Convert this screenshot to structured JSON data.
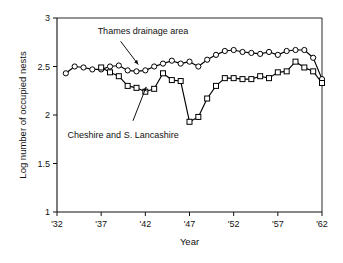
{
  "chart_data": {
    "type": "line",
    "title": "",
    "xlabel": "Year",
    "ylabel": "Log number of occupied nests",
    "xlim": [
      1932,
      1962
    ],
    "ylim": [
      1,
      3
    ],
    "grid": false,
    "legend_position": "inline-annotations",
    "xticks": [
      1932,
      1937,
      1942,
      1947,
      1952,
      1957,
      1962
    ],
    "xtick_labels": [
      "'32",
      "'37",
      "'42",
      "'47",
      "'52",
      "'57",
      "'62"
    ],
    "yticks": [
      1,
      1.5,
      2,
      2.5,
      3
    ],
    "ytick_labels": [
      "1",
      "1.5",
      "2",
      "2.5",
      "3"
    ],
    "series": [
      {
        "name": "Thames drainage area",
        "marker": "open-circle",
        "color": "#000000",
        "x": [
          1933,
          1934,
          1935,
          1936,
          1937,
          1938,
          1939,
          1940,
          1941,
          1942,
          1943,
          1944,
          1945,
          1946,
          1947,
          1948,
          1949,
          1950,
          1951,
          1952,
          1953,
          1954,
          1955,
          1956,
          1957,
          1958,
          1959,
          1960,
          1961,
          1962
        ],
        "y": [
          2.43,
          2.5,
          2.49,
          2.47,
          2.47,
          2.5,
          2.51,
          2.46,
          2.45,
          2.46,
          2.5,
          2.53,
          2.56,
          2.53,
          2.55,
          2.5,
          2.57,
          2.62,
          2.66,
          2.67,
          2.65,
          2.64,
          2.63,
          2.65,
          2.62,
          2.66,
          2.67,
          2.67,
          2.59,
          2.37
        ]
      },
      {
        "name": "Cheshire and S. Lancashire",
        "marker": "open-square",
        "color": "#000000",
        "x": [
          1937,
          1938,
          1939,
          1940,
          1941,
          1942,
          1943,
          1944,
          1945,
          1946,
          1947,
          1948,
          1949,
          1950,
          1951,
          1952,
          1953,
          1954,
          1955,
          1956,
          1957,
          1958,
          1959,
          1960,
          1961,
          1962
        ],
        "y": [
          2.49,
          2.44,
          2.4,
          2.3,
          2.28,
          2.24,
          2.27,
          2.43,
          2.36,
          2.35,
          1.93,
          1.98,
          2.17,
          2.3,
          2.38,
          2.38,
          2.37,
          2.37,
          2.4,
          2.38,
          2.44,
          2.45,
          2.55,
          2.49,
          2.45,
          2.33
        ]
      }
    ],
    "annotations": [
      {
        "text": "Thames drainage area",
        "text_x": 1936.6,
        "text_y": 2.84,
        "arrow_to_x": 1941.2,
        "arrow_to_y": 2.52,
        "arrow_from_x": 1939.2,
        "arrow_from_y": 2.76
      },
      {
        "text": "Cheshire and S. Lancashire",
        "text_x": 1933.2,
        "text_y": 1.76,
        "arrow_to_x": 1942.1,
        "arrow_to_y": 2.29,
        "arrow_from_x": 1940.6,
        "arrow_from_y": 1.94
      }
    ]
  }
}
